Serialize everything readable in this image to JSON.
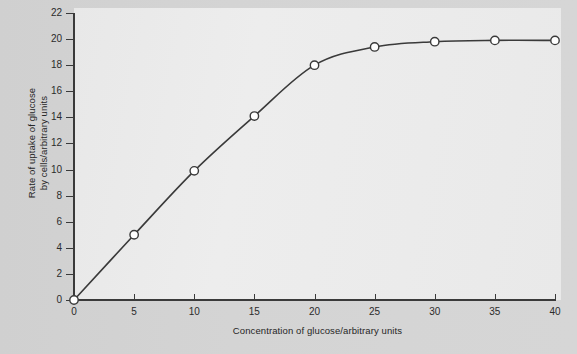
{
  "chart_data": {
    "type": "line",
    "title": "",
    "xlabel": "Concentration of glucose/arbitrary units",
    "ylabel": "Rate of uptake of glucose by cells/arbitrary units",
    "ylabel_line1": "Rate of uptake of glucose",
    "ylabel_line2": "by cells/arbitrary units",
    "x": [
      0,
      5,
      10,
      15,
      20,
      25,
      30,
      35,
      40
    ],
    "values": [
      0,
      5.0,
      9.9,
      14.1,
      18.0,
      19.4,
      19.8,
      19.9,
      19.9
    ],
    "series": [
      {
        "name": "Rate of uptake of glucose",
        "values": [
          0,
          5.0,
          9.9,
          14.1,
          18.0,
          19.4,
          19.8,
          19.9,
          19.9
        ]
      }
    ],
    "xlim": [
      0,
      40
    ],
    "ylim": [
      0,
      22
    ],
    "xticks": [
      0,
      5,
      10,
      15,
      20,
      25,
      30,
      35,
      40
    ],
    "yticks": [
      0,
      2,
      4,
      6,
      8,
      10,
      12,
      14,
      16,
      18,
      20,
      22
    ],
    "xtick_labels": [
      "0",
      "5",
      "10",
      "15",
      "20",
      "25",
      "30",
      "35",
      "40"
    ],
    "ytick_labels": [
      "0",
      "2",
      "4",
      "6",
      "8",
      "10",
      "12",
      "14",
      "16",
      "18",
      "20",
      "22"
    ],
    "grid": false,
    "legend": null,
    "marker": "open-circle",
    "line_color": "#3a3a3a",
    "marker_fill": "#ffffff",
    "marker_stroke": "#3a3a3a",
    "plot_background": "#ebebeb",
    "figure_background": "#d2d2d2"
  }
}
